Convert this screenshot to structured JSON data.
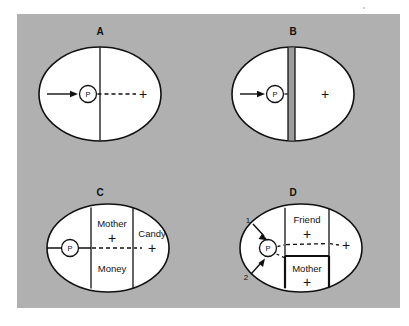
{
  "figure": {
    "background_color": "#ffffff",
    "panel_color": "#b0b0b0",
    "ink_color": "#111111",
    "barrier_color": "#9d9d9d",
    "region_color": "#ffffff"
  },
  "panels": [
    {
      "id": "A",
      "letter": "A",
      "person_label": "P",
      "goal_sign": "+",
      "regions": [],
      "arrows": [],
      "description": "Person P with locomotion arrow toward a positive valence goal across a simple boundary"
    },
    {
      "id": "B",
      "letter": "B",
      "person_label": "P",
      "goal_sign": "+",
      "regions": [],
      "arrows": [],
      "description": "Person P blocked from positive goal by an impassable barrier region"
    },
    {
      "id": "C",
      "letter": "C",
      "person_label": "P",
      "goal_sign": "+",
      "regions": [
        {
          "label": "Mother",
          "sign": "+"
        },
        {
          "label": "Money",
          "sign": ""
        },
        {
          "label": "Candy",
          "sign": "+"
        }
      ],
      "arrows": [],
      "description": "Path from P through Mother and Money regions to Candy goal"
    },
    {
      "id": "D",
      "letter": "D",
      "person_label": "P",
      "goal_sign": "+",
      "regions": [
        {
          "label": "Friend",
          "sign": "+"
        },
        {
          "label": "Mother",
          "sign": "+"
        }
      ],
      "arrows": [
        {
          "label": "1"
        },
        {
          "label": "2"
        }
      ],
      "description": "Person P under two competing forces toward Friend and Mother regions"
    }
  ]
}
